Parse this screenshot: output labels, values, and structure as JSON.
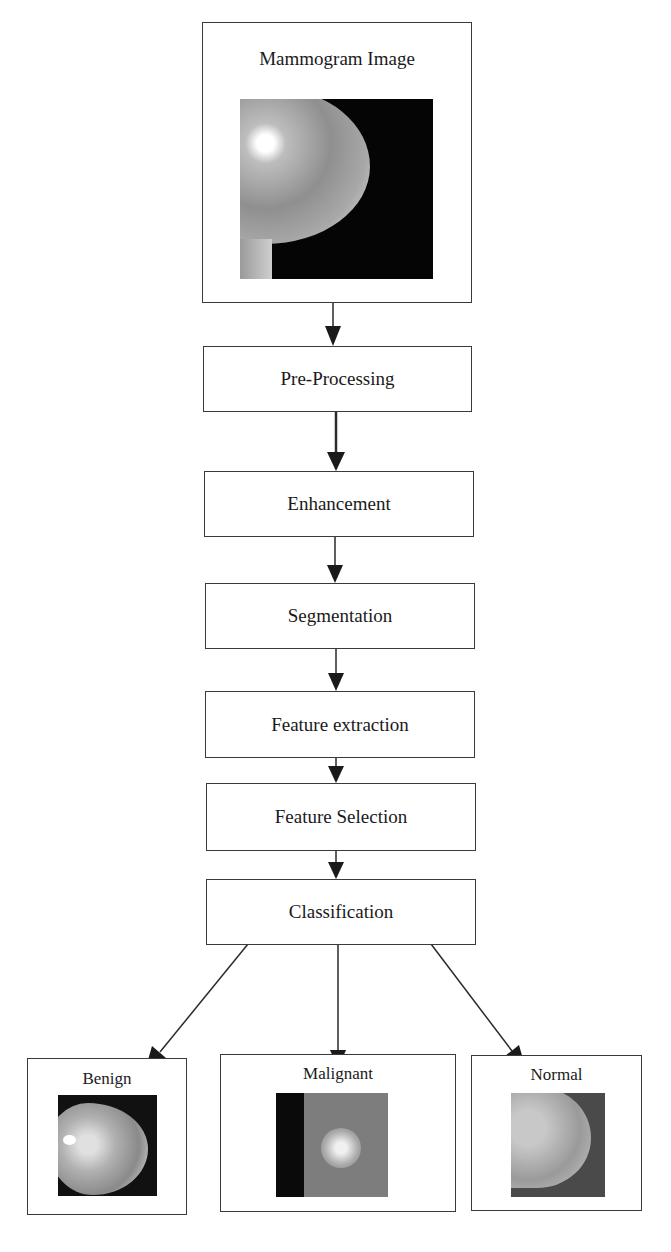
{
  "diagram": {
    "input": {
      "label": "Mammogram Image"
    },
    "steps": [
      {
        "label": "Pre-Processing"
      },
      {
        "label": "Enhancement"
      },
      {
        "label": "Segmentation"
      },
      {
        "label": "Feature extraction"
      },
      {
        "label": "Feature Selection"
      },
      {
        "label": "Classification"
      }
    ],
    "outputs": [
      {
        "label": "Benign"
      },
      {
        "label": "Malignant"
      },
      {
        "label": "Normal"
      }
    ]
  }
}
